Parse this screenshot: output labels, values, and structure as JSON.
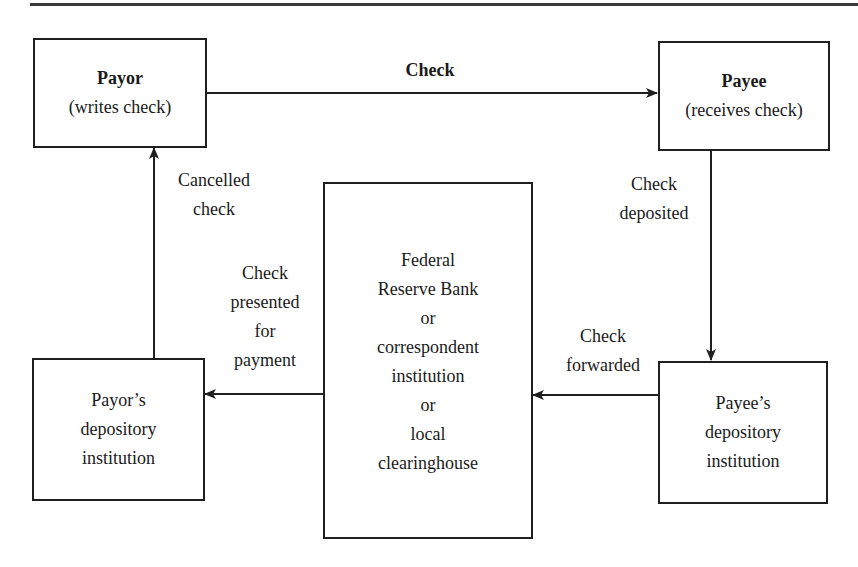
{
  "diagram": {
    "nodes": {
      "payor": {
        "title": "Payor",
        "subtitle": "(writes check)"
      },
      "payee": {
        "title": "Payee",
        "subtitle": "(receives check)"
      },
      "clearing": {
        "lines": [
          "Federal",
          "Reserve Bank",
          "or",
          "correspondent",
          "institution",
          "or",
          "local",
          "clearinghouse"
        ]
      },
      "payor_depository": {
        "lines": [
          "Payor’s",
          "depository",
          "institution"
        ]
      },
      "payee_depository": {
        "lines": [
          "Payee’s",
          "depository",
          "institution"
        ]
      }
    },
    "edges": {
      "check": {
        "label": "Check",
        "from": "Payor",
        "to": "Payee"
      },
      "check_deposited": {
        "lines": [
          "Check",
          "deposited"
        ],
        "from": "Payee",
        "to": "Payee’s depository institution"
      },
      "check_forwarded": {
        "lines": [
          "Check",
          "forwarded"
        ],
        "from": "Payee’s depository institution",
        "to": "Federal Reserve Bank or correspondent institution or local clearinghouse"
      },
      "check_presented": {
        "lines": [
          "Check",
          "presented",
          "for",
          "payment"
        ],
        "from": "Federal Reserve Bank or correspondent institution or local clearinghouse",
        "to": "Payor’s depository institution"
      },
      "cancelled_check": {
        "lines": [
          "Cancelled",
          "check"
        ],
        "from": "Payor’s depository institution",
        "to": "Payor"
      }
    }
  }
}
